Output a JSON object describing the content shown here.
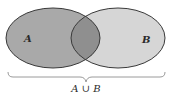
{
  "diagram": {
    "type": "venn",
    "sets": [
      {
        "label": "A",
        "fill": "#a9a9a9"
      },
      {
        "label": "B",
        "fill": "#d6d6d6"
      }
    ],
    "intersection_fill": "#8f8f8f",
    "outline": "#3a3a3a",
    "brace_label": "A ∪ B"
  }
}
